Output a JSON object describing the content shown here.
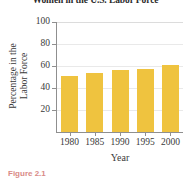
{
  "figure": {
    "caption": "Figure 2.1"
  },
  "chart_data": {
    "type": "bar",
    "title": "Women in the U.S. Labor Force",
    "xlabel": "Year",
    "ylabel_line1": "Percentage in the",
    "ylabel_line2": "Labor Force",
    "ylabel": "Percentage in the Labor Force",
    "categories": [
      "1980",
      "1985",
      "1990",
      "1995",
      "2000"
    ],
    "values": [
      51,
      53.5,
      56,
      57,
      61
    ],
    "ylim": [
      0,
      100
    ],
    "yticks": [
      20,
      40,
      60,
      80,
      100
    ],
    "ytick_labels": [
      "20",
      "40",
      "60",
      "80",
      "100"
    ],
    "grid": true,
    "legend": "none",
    "bar_color": "#efc33f",
    "axis_color": "#8f8f8f",
    "grid_color": "#e9e9e9"
  }
}
